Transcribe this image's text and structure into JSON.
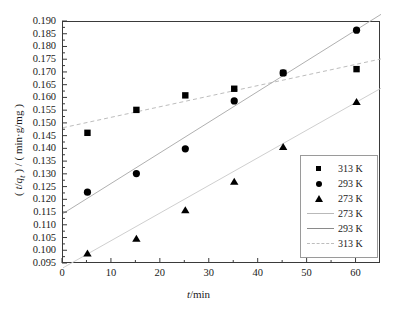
{
  "figure": {
    "background": "#ffffff",
    "frame_color": "#3a3a3a"
  },
  "axes": {
    "xlabel": "t/min",
    "xlabel_italic_part": "t",
    "xlabel_rest": "/min",
    "ylabel": "( t/q t ) / ( min·g/mg )",
    "ylabel_lead": "( ",
    "ylabel_var": "t",
    "ylabel_slash": "/",
    "ylabel_var2": "q",
    "ylabel_sub": "t",
    "ylabel_mid": " ) / ( min",
    "ylabel_dot": "·",
    "ylabel_tail": "g/mg )",
    "xticks": [
      "0",
      "10",
      "20",
      "30",
      "40",
      "50",
      "60"
    ],
    "yticks": [
      "0.190",
      "0.185",
      "0.180",
      "0.175",
      "0.170",
      "0.165",
      "0.160",
      "0.155",
      "0.150",
      "0.145",
      "0.140",
      "0.135",
      "0.130",
      "0.125",
      "0.120",
      "0.115",
      "0.110",
      "0.105",
      "0.100",
      "0.095"
    ]
  },
  "legend": {
    "border_color": "#9a9a9a",
    "entries": [
      {
        "label": "313 K",
        "key": "square-marker"
      },
      {
        "label": "293 K",
        "key": "circle-marker"
      },
      {
        "label": "273 K",
        "key": "triangle-marker"
      },
      {
        "label": "273 K",
        "key": "line-solid-light"
      },
      {
        "label": "293 K",
        "key": "line-solid-dark"
      },
      {
        "label": "313 K",
        "key": "line-dashed"
      }
    ]
  },
  "chart_data": {
    "type": "scatter",
    "title": "",
    "xlabel": "t/min",
    "ylabel": "( t/qt ) / ( min·g/mg )",
    "xlim": [
      0,
      65
    ],
    "ylim": [
      0.095,
      0.19
    ],
    "grid": false,
    "legend_position": "lower right",
    "x": [
      5,
      15,
      25,
      35,
      45,
      60
    ],
    "series": [
      {
        "name": "313 K",
        "marker": "square",
        "color": "#000000",
        "values": [
          0.1465,
          0.1555,
          0.1612,
          0.1638,
          0.17,
          0.1715
        ],
        "fit": {
          "style": "dashed",
          "color": "#bdbdbd",
          "x0": 0,
          "y0": 0.1485,
          "x1": 65,
          "y1": 0.1755
        }
      },
      {
        "name": "293 K",
        "marker": "circle",
        "color": "#000000",
        "values": [
          0.1232,
          0.1305,
          0.1402,
          0.159,
          0.17,
          0.1868
        ],
        "fit": {
          "style": "solid",
          "color": "#b0b0b0",
          "x0": 0,
          "y0": 0.1148,
          "x1": 65,
          "y1": 0.193
        }
      },
      {
        "name": "273 K",
        "marker": "triangle",
        "color": "#000000",
        "values": [
          0.099,
          0.1048,
          0.116,
          0.1272,
          0.1408,
          0.1585
        ],
        "fit": {
          "style": "solid",
          "color": "#cfcfcf",
          "x0": 0,
          "y0": 0.0935,
          "x1": 65,
          "y1": 0.164
        }
      }
    ]
  }
}
